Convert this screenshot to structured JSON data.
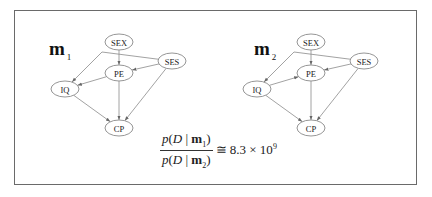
{
  "diagram": {
    "type": "bayesian-network-comparison",
    "models": [
      {
        "label": "m",
        "subscript": "1",
        "nodes": [
          {
            "id": "SEX",
            "label": "SEX",
            "x": 119,
            "y": 42
          },
          {
            "id": "SES",
            "label": "SES",
            "x": 172,
            "y": 61
          },
          {
            "id": "PE",
            "label": "PE",
            "x": 119,
            "y": 73
          },
          {
            "id": "IQ",
            "label": "IQ",
            "x": 65,
            "y": 89
          },
          {
            "id": "CP",
            "label": "CP",
            "x": 119,
            "y": 128
          }
        ],
        "edges": [
          {
            "from": "SEX",
            "to": "PE"
          },
          {
            "from": "SES",
            "to": "PE"
          },
          {
            "from": "SES",
            "to": "IQ"
          },
          {
            "from": "SES",
            "to": "CP"
          },
          {
            "from": "PE",
            "to": "IQ"
          },
          {
            "from": "PE",
            "to": "CP"
          },
          {
            "from": "IQ",
            "to": "CP"
          }
        ]
      },
      {
        "label": "m",
        "subscript": "2",
        "nodes": [
          {
            "id": "SEX",
            "label": "SEX",
            "x": 311,
            "y": 42
          },
          {
            "id": "SES",
            "label": "SES",
            "x": 364,
            "y": 61
          },
          {
            "id": "PE",
            "label": "PE",
            "x": 311,
            "y": 73
          },
          {
            "id": "IQ",
            "label": "IQ",
            "x": 257,
            "y": 89
          },
          {
            "id": "CP",
            "label": "CP",
            "x": 311,
            "y": 128
          }
        ],
        "edges": [
          {
            "from": "SEX",
            "to": "PE"
          },
          {
            "from": "SES",
            "to": "PE"
          },
          {
            "from": "SES",
            "to": "IQ"
          },
          {
            "from": "SES",
            "to": "CP"
          },
          {
            "from": "IQ",
            "to": "PE"
          },
          {
            "from": "PE",
            "to": "CP"
          },
          {
            "from": "IQ",
            "to": "CP"
          }
        ]
      }
    ],
    "formula": {
      "numerator": {
        "p": "p",
        "open": "(",
        "D": "D",
        "bar": " | ",
        "m": "m",
        "sub": "1",
        "close": ")"
      },
      "denominator": {
        "p": "p",
        "open": "(",
        "D": "D",
        "bar": " | ",
        "m": "m",
        "sub": "2",
        "close": ")"
      },
      "relation": "≅",
      "value": "8.3 × 10",
      "exponent": "9"
    }
  }
}
